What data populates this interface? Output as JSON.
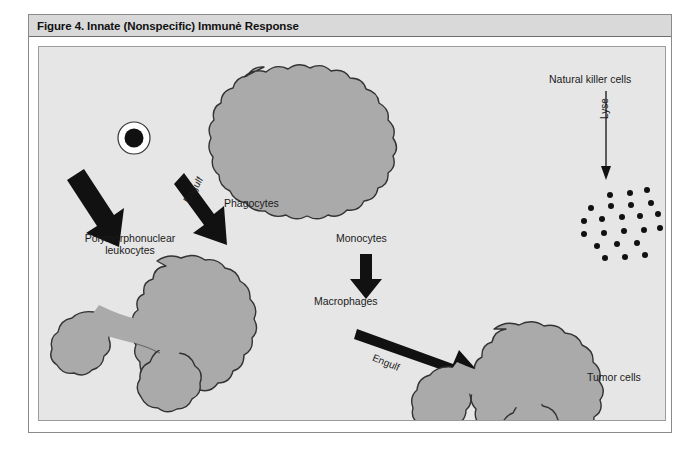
{
  "figure": {
    "title": "Figure 4. Innate (Nonspecific) Immunė Response",
    "background_color": "#e6e6e6",
    "title_bar_color": "#d9d9d9",
    "cell_fill_color": "#aaaaaa",
    "outline_color": "#333333"
  },
  "labels": {
    "phagocytes": "Phagocytes",
    "polymorphonuclear_leukocytes": "Polymorphonuclear\nleukocytes",
    "polymorphonuclear_line1": "Polymorphonuclear",
    "polymorphonuclear_line2": "leukocytes",
    "monocytes": "Monocytes",
    "macrophages": "Macrophages",
    "natural_killer_cells": "Natural killer cells",
    "tumor_cells": "Tumor cells",
    "engulf_left": "Engulf",
    "engulf_right": "Engulf",
    "lyse": "Lyse"
  },
  "diagram": {
    "type": "flow-diagram",
    "nodes": [
      {
        "id": "phagocyte-cell",
        "label": "Phagocytes",
        "shape": "lobed-cell-with-nucleus",
        "x": 240,
        "y": 90
      },
      {
        "id": "polymorphonuclear-cell",
        "label": "Polymorphonuclear leukocytes",
        "shape": "amoeboid-cell",
        "x": 148,
        "y": 300
      },
      {
        "id": "monocyte-node",
        "label": "Monocytes",
        "shape": "text-node",
        "x": 330,
        "y": 190
      },
      {
        "id": "macrophage-node",
        "label": "Macrophages",
        "shape": "text-node",
        "x": 318,
        "y": 253
      },
      {
        "id": "macrophage-cell",
        "label": "Macrophage",
        "shape": "amoeboid-cell",
        "x": 512,
        "y": 315
      },
      {
        "id": "natural-killer-node",
        "label": "Natural killer cells",
        "shape": "text-node",
        "x": 566,
        "y": 32
      },
      {
        "id": "tumor-cell-cluster",
        "label": "Tumor cells",
        "shape": "dot-cluster",
        "x": 580,
        "y": 265,
        "dot_count": 22
      }
    ],
    "arrows": [
      {
        "id": "arrow-engulf-left",
        "from": "phagocyte-cell",
        "to": "polymorphonuclear-cell",
        "label": "Engulf",
        "style": "thick"
      },
      {
        "id": "arrow-to-monocytes",
        "from": "phagocyte-cell",
        "to": "monocyte-node",
        "label": "",
        "style": "thick"
      },
      {
        "id": "arrow-monocytes-to-macrophages",
        "from": "monocyte-node",
        "to": "macrophage-node",
        "label": "",
        "style": "thick"
      },
      {
        "id": "arrow-engulf-right",
        "from": "macrophage-node",
        "to": "macrophage-cell",
        "label": "Engulf",
        "style": "thick"
      },
      {
        "id": "arrow-lyse",
        "from": "natural-killer-node",
        "to": "tumor-cell-cluster",
        "label": "Lyse",
        "style": "thin"
      }
    ]
  }
}
